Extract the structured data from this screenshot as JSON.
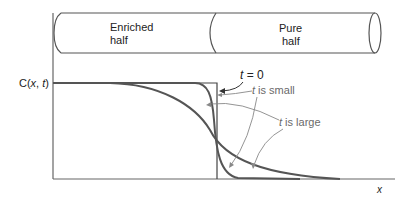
{
  "diagram": {
    "bar": {
      "left_label_line1": "Enriched",
      "left_label_line2": "half",
      "right_label_line1": "Pure",
      "right_label_line2": "half"
    },
    "axes": {
      "y_label_prefix": "C(",
      "y_label_x": "x",
      "y_label_sep": ", ",
      "y_label_t": "t",
      "y_label_suffix": ")",
      "x_label": "x"
    },
    "annotations": {
      "t0_t": "t",
      "t0_rest": " = 0",
      "small_t": "t",
      "small_rest": " is small",
      "large_t": "t",
      "large_rest": " is large"
    },
    "colors": {
      "axis": "#555555",
      "curve": "#555555",
      "step": "#444444",
      "arrow_dark": "#333333",
      "arrow_gray": "#888888"
    }
  }
}
